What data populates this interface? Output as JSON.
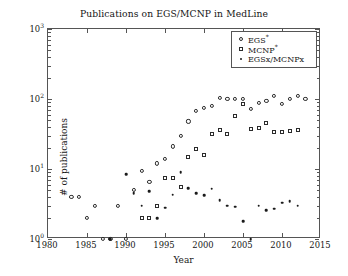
{
  "chart_data": {
    "type": "scatter",
    "title": "Publications on EGS/MCNP in MedLine",
    "xlabel": "Year",
    "ylabel": "# of publications",
    "xlim": [
      1980,
      2015
    ],
    "ylim": [
      1,
      1000
    ],
    "yscale": "log",
    "xscale": "linear",
    "grid": false,
    "legend_position": "upper-right",
    "xticks": [
      1980,
      1985,
      1990,
      1995,
      2000,
      2005,
      2010,
      2015
    ],
    "xtick_labels": [
      "1980",
      "1985",
      "1990",
      "1995",
      "2000",
      "2005",
      "2010",
      "2015"
    ],
    "yticks": [
      1,
      10,
      100,
      1000
    ],
    "ytick_labels": [
      "10",
      "10",
      "10",
      "10"
    ],
    "ytick_exponents": [
      "0",
      "1",
      "2",
      "3"
    ],
    "series": [
      {
        "name": "EGS*",
        "marker": "open-circle",
        "color": "#2b2b2b",
        "points": [
          [
            1983,
            4
          ],
          [
            1984,
            4
          ],
          [
            1985,
            2
          ],
          [
            1986,
            3
          ],
          [
            1987,
            1
          ],
          [
            1988,
            1
          ],
          [
            1989,
            3
          ],
          [
            1990,
            1
          ],
          [
            1991,
            5
          ],
          [
            1992,
            9.5
          ],
          [
            1993,
            6.5
          ],
          [
            1994,
            12
          ],
          [
            1995,
            14
          ],
          [
            1996,
            21
          ],
          [
            1997,
            30
          ],
          [
            1998,
            48
          ],
          [
            1999,
            67
          ],
          [
            2000,
            75
          ],
          [
            2001,
            80
          ],
          [
            2002,
            105
          ],
          [
            2003,
            100
          ],
          [
            2004,
            100
          ],
          [
            2005,
            100
          ],
          [
            2006,
            72
          ],
          [
            2007,
            87
          ],
          [
            2008,
            95
          ],
          [
            2009,
            110
          ],
          [
            2010,
            85
          ],
          [
            2011,
            100
          ],
          [
            2012,
            110
          ],
          [
            2013,
            100
          ]
        ]
      },
      {
        "name": "MCNP*",
        "marker": "open-square",
        "color": "#2b2b2b",
        "points": [
          [
            1992,
            2
          ],
          [
            1993,
            2
          ],
          [
            1994,
            3
          ],
          [
            1995,
            7.5
          ],
          [
            1996,
            7.5
          ],
          [
            1997,
            5.5
          ],
          [
            1998,
            15
          ],
          [
            1999,
            19
          ],
          [
            2000,
            16
          ],
          [
            2001,
            32
          ],
          [
            2002,
            36
          ],
          [
            2003,
            32
          ],
          [
            2004,
            57
          ],
          [
            2005,
            85
          ],
          [
            2006,
            37
          ],
          [
            2007,
            38
          ],
          [
            2008,
            45
          ],
          [
            2009,
            34
          ],
          [
            2010,
            34
          ],
          [
            2011,
            35
          ],
          [
            2012,
            36
          ]
        ]
      },
      {
        "name": "EGSx/MCNPx",
        "marker": "filled-dot",
        "color": "#1a1a1a",
        "points": [
          [
            1988,
            1
          ],
          [
            1990,
            8.5
          ],
          [
            1991,
            4.5
          ],
          [
            1992,
            3
          ],
          [
            1993,
            4.8
          ],
          [
            1994,
            2
          ],
          [
            1995,
            2.8
          ],
          [
            1996,
            4.3
          ],
          [
            1997,
            9
          ],
          [
            1998,
            5.3
          ],
          [
            1999,
            4.5
          ],
          [
            2000,
            4.2
          ],
          [
            2001,
            5.2
          ],
          [
            2002,
            3.6
          ],
          [
            2003,
            3
          ],
          [
            2004,
            2.9
          ],
          [
            2005,
            1.8
          ],
          [
            2006,
            1
          ],
          [
            2007,
            3
          ],
          [
            2008,
            2.6
          ],
          [
            2009,
            2.7
          ],
          [
            2010,
            3.3
          ],
          [
            2011,
            3.5
          ],
          [
            2012,
            3
          ]
        ]
      }
    ]
  },
  "legend": {
    "entries": [
      {
        "label": "EGS",
        "sup": "*",
        "marker": "open-circle"
      },
      {
        "label": "MCNP",
        "sup": "*",
        "marker": "open-square"
      },
      {
        "label": "EGSx/MCNPx",
        "sup": "",
        "marker": "filled-dot"
      }
    ]
  }
}
